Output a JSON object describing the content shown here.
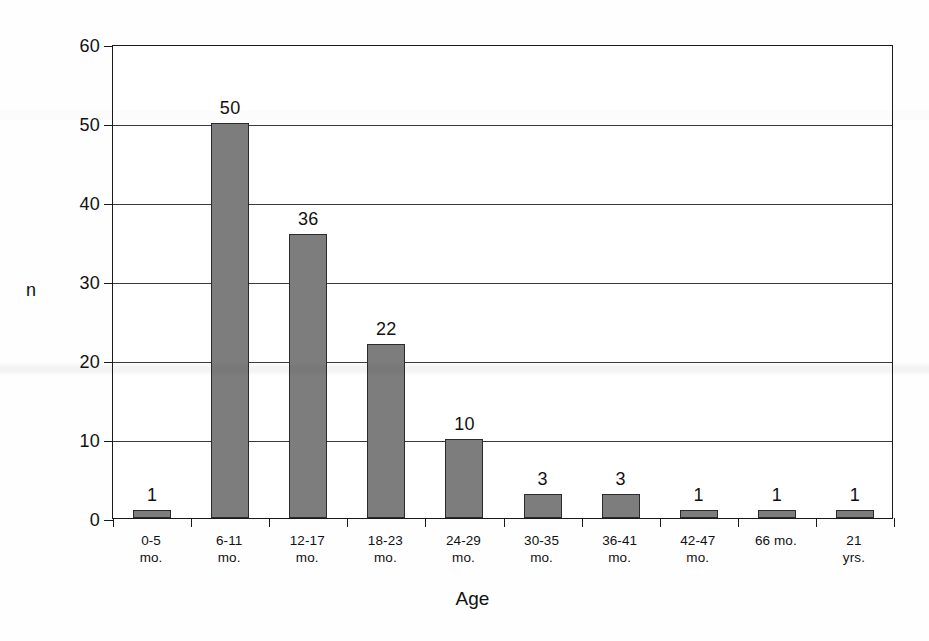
{
  "chart_data": {
    "type": "bar",
    "title": "",
    "subtitle": "",
    "xlabel": "Age",
    "ylabel": "n",
    "categories": [
      "0-5\nmo.",
      "6-11\nmo.",
      "12-17\nmo.",
      "18-23\nmo.",
      "24-29\nmo.",
      "30-35\nmo.",
      "36-41\nmo.",
      "42-47\nmo.",
      "66 mo.",
      "21\nyrs."
    ],
    "category_lines": [
      [
        "0-5",
        "mo."
      ],
      [
        "6-11",
        "mo."
      ],
      [
        "12-17",
        "mo."
      ],
      [
        "18-23",
        "mo."
      ],
      [
        "24-29",
        "mo."
      ],
      [
        "30-35",
        "mo."
      ],
      [
        "36-41",
        "mo."
      ],
      [
        "42-47",
        "mo."
      ],
      [
        "66 mo.",
        ""
      ],
      [
        "21",
        "yrs."
      ]
    ],
    "values": [
      1,
      50,
      36,
      22,
      10,
      3,
      3,
      1,
      1,
      1
    ],
    "data_labels": [
      "1",
      "50",
      "36",
      "22",
      "10",
      "3",
      "3",
      "1",
      "1",
      "1"
    ],
    "ylim": [
      0,
      60
    ],
    "yticks": [
      0,
      10,
      20,
      30,
      40,
      50,
      60
    ],
    "ytick_labels": [
      "0",
      "10",
      "20",
      "30",
      "40",
      "50",
      "60"
    ],
    "grid": "horizontal",
    "legend": "none",
    "bar_color": "#7d7d7d",
    "bar_edge_color": "#2b2b2b",
    "axis_color": "#1a1a1a",
    "grid_color": "#3a3a3a",
    "background_color": "#ffffff"
  }
}
